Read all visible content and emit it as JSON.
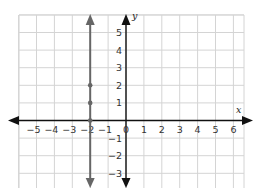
{
  "chart_data": {
    "type": "line",
    "title": "",
    "xlabel": "x",
    "ylabel": "y",
    "xlim": [
      -6,
      6.5
    ],
    "ylim": [
      -3.8,
      5.9
    ],
    "grid": true,
    "x_ticks": [
      -5,
      -4,
      -3,
      -2,
      -1,
      0,
      1,
      2,
      3,
      4,
      5,
      6
    ],
    "y_ticks": [
      -3,
      -2,
      -1,
      1,
      2,
      3,
      4,
      5
    ],
    "x_tick_labels": [
      "−5",
      "−4",
      "−3",
      "−2",
      "−1",
      "0",
      "1",
      "2",
      "3",
      "4",
      "5",
      "6"
    ],
    "y_tick_labels": [
      "−3",
      "−2",
      "−1",
      "1",
      "2",
      "3",
      "4",
      "5"
    ],
    "series": [
      {
        "name": "x = -2",
        "kind": "vertical line",
        "x": -2,
        "color": "#666666",
        "points": [
          {
            "x": -2,
            "y": 0
          },
          {
            "x": -2,
            "y": 1
          },
          {
            "x": -2,
            "y": 2
          }
        ]
      }
    ]
  },
  "labels": {
    "x_axis": "x",
    "y_axis": "y"
  }
}
